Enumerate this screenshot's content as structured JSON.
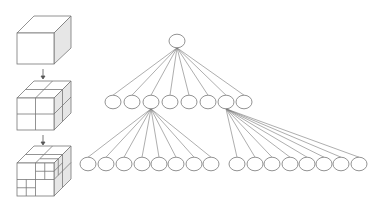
{
  "diagram": {
    "cubes": [
      {
        "level": 0,
        "label": "undivided cube"
      },
      {
        "level": 1,
        "label": "cube split into 8 octants"
      },
      {
        "level": 2,
        "label": "octants further subdivided"
      }
    ],
    "tree": {
      "root": {
        "x": 177,
        "y": 41
      },
      "level1_y": 102,
      "level1_x": [
        113,
        132,
        151,
        170,
        189,
        208,
        226,
        244
      ],
      "level2_y": 164,
      "level2_left_parent_index": 2,
      "level2_left_x": [
        88,
        106,
        124,
        142,
        159,
        176,
        194,
        211
      ],
      "level2_right_parent_index": 6,
      "level2_right_x": [
        237,
        255,
        272,
        290,
        307,
        324,
        341,
        359
      ],
      "node_radius": 8
    },
    "colors": {
      "stroke": "#777777",
      "side_face": "#e4e4e4",
      "top_face": "#ffffff"
    }
  }
}
